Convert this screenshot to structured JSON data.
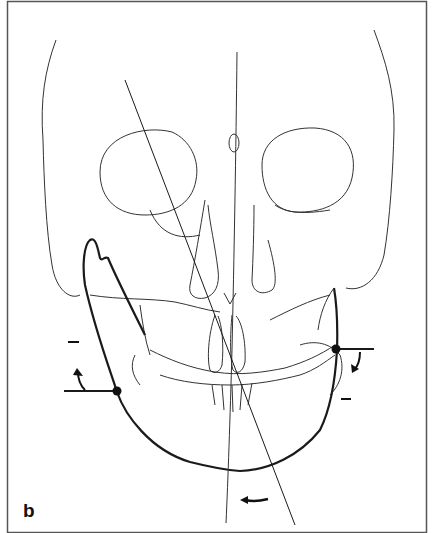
{
  "figure": {
    "panel_label": "b",
    "annotations": {
      "left_minus": "–",
      "right_minus": "–"
    },
    "colors": {
      "line": "#1a1a1a",
      "thin_line": "#333333",
      "background": "#ffffff",
      "border": "#555555"
    }
  }
}
